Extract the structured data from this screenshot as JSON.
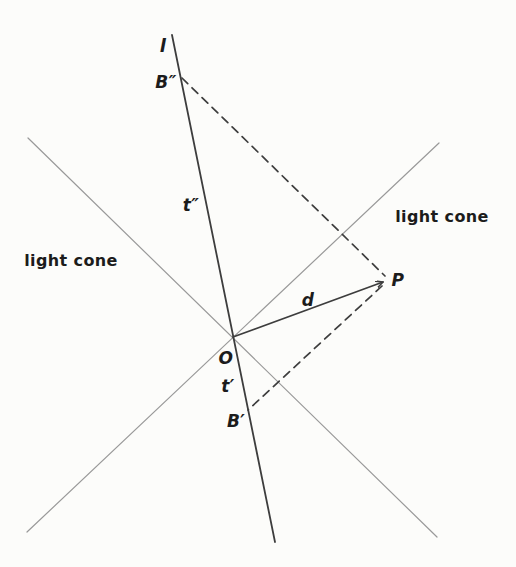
{
  "diagram": {
    "title_hidden": "",
    "background": "#fcfcfa",
    "colors": {
      "cone": "#999999",
      "ink": "#3d3d3d",
      "text": "#1c1c1c"
    },
    "points": {
      "O": {
        "x": 233,
        "y": 337
      },
      "P": {
        "x": 388,
        "y": 280
      },
      "B_double_prime": {
        "x": 182,
        "y": 78
      },
      "B_prime": {
        "x": 248,
        "y": 410
      }
    },
    "lines": [
      {
        "name": "light-cone-line-nw-se",
        "x1": 28,
        "y1": 138,
        "x2": 437,
        "y2": 537,
        "stroke": "cone",
        "width": 1.2,
        "dash": "",
        "arrow": false
      },
      {
        "name": "light-cone-line-sw-ne",
        "x1": 27,
        "y1": 532,
        "x2": 439,
        "y2": 143,
        "stroke": "cone",
        "width": 1.2,
        "dash": "",
        "arrow": false
      },
      {
        "name": "worldline-l",
        "x1": 172,
        "y1": 35,
        "x2": 275,
        "y2": 542,
        "stroke": "ink",
        "width": 1.8,
        "dash": "",
        "arrow": false
      },
      {
        "name": "segment-d-arrow",
        "x1": 233,
        "y1": 337,
        "x2": 383,
        "y2": 282,
        "stroke": "ink",
        "width": 1.7,
        "dash": "",
        "arrow": true
      },
      {
        "name": "dashed-signal-B2-to-P",
        "x1": 182,
        "y1": 78,
        "x2": 385,
        "y2": 276,
        "stroke": "ink",
        "width": 1.7,
        "dash": "8 6",
        "arrow": false
      },
      {
        "name": "dashed-signal-P-to-B1",
        "x1": 382,
        "y1": 286,
        "x2": 248,
        "y2": 410,
        "stroke": "ink",
        "width": 1.7,
        "dash": "8 6",
        "arrow": false
      }
    ],
    "labels": [
      {
        "name": "worldline-l-label",
        "text": "l",
        "x": 163,
        "y": 52,
        "italic": true,
        "size": 18
      },
      {
        "name": "point-B2-label",
        "text": "B″",
        "x": 166,
        "y": 88,
        "italic": true,
        "size": 17
      },
      {
        "name": "segment-t2-label",
        "text": "t″",
        "x": 191,
        "y": 211,
        "italic": true,
        "size": 17
      },
      {
        "name": "light-cone-left-label",
        "text": "light cone",
        "x": 71,
        "y": 266,
        "italic": false,
        "size": 16
      },
      {
        "name": "light-cone-right-label",
        "text": "light cone",
        "x": 442,
        "y": 222,
        "italic": false,
        "size": 16
      },
      {
        "name": "segment-d-label",
        "text": "d",
        "x": 308,
        "y": 306,
        "italic": true,
        "size": 17
      },
      {
        "name": "point-P-label",
        "text": "P",
        "x": 398,
        "y": 286,
        "italic": true,
        "size": 17
      },
      {
        "name": "point-O-label",
        "text": "O",
        "x": 226,
        "y": 364,
        "italic": true,
        "size": 17
      },
      {
        "name": "segment-t1-label",
        "text": "t′",
        "x": 228,
        "y": 392,
        "italic": true,
        "size": 17
      },
      {
        "name": "point-B1-label",
        "text": "B′",
        "x": 236,
        "y": 427,
        "italic": true,
        "size": 17
      }
    ]
  }
}
